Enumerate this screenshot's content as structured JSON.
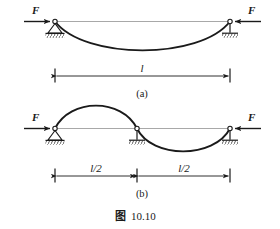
{
  "figure": {
    "caption_cjk": "图",
    "caption_number": "10.10",
    "panels": [
      {
        "id": "a",
        "label": "(a)",
        "force_left_label": "F",
        "force_right_label": "F",
        "dimension_label": "l",
        "left_support_type": "pinned-support-icon",
        "right_support_type": "roller-support-icon",
        "buckling_mode": "single half sine wave, deflecting downward"
      },
      {
        "id": "b",
        "label": "(b)",
        "force_left_label": "F",
        "force_right_label": "F",
        "dimension_label_left": "l/2",
        "dimension_label_right": "l/2",
        "left_support_type": "pinned-support-icon",
        "middle_support_type": "roller-support-icon",
        "right_support_type": "roller-support-icon",
        "buckling_mode": "full sine wave, up then down"
      }
    ]
  },
  "colors": {
    "ink": "#1a1a1a",
    "axis": "#9a9a9a",
    "background": "#ffffff"
  }
}
